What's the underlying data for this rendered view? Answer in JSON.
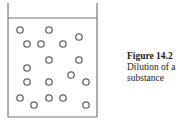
{
  "figure": {
    "label": "Figure 14.2",
    "caption_lines": [
      "Dilution of a",
      "substance"
    ]
  },
  "diagram": {
    "particle_count": 18,
    "colors": {
      "stroke": "#666666",
      "background": "#ffffff"
    }
  }
}
